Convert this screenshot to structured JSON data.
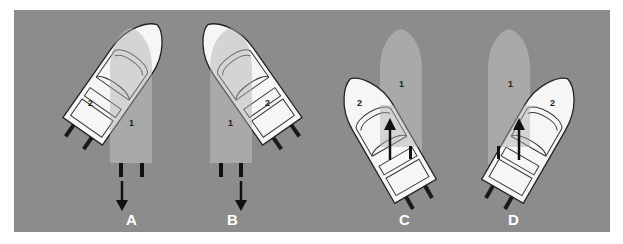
{
  "diagram": {
    "background_color": "#8c8c8c",
    "boat1_color": "#a9a9a9",
    "boat2_color": "#ffffff",
    "panels": [
      {
        "label": "A",
        "boat1_number": "1",
        "boat2_number": "2",
        "boat1_arrow": "down",
        "boat2_heading": "up-right"
      },
      {
        "label": "B",
        "boat1_number": "1",
        "boat2_number": "2",
        "boat1_arrow": "down",
        "boat2_heading": "up-left"
      },
      {
        "label": "C",
        "boat1_number": "1",
        "boat2_number": "2",
        "boat2_arrow": "up",
        "boat2_heading": "up-left"
      },
      {
        "label": "D",
        "boat1_number": "1",
        "boat2_number": "2",
        "boat2_arrow": "up",
        "boat2_heading": "up-right"
      }
    ]
  }
}
